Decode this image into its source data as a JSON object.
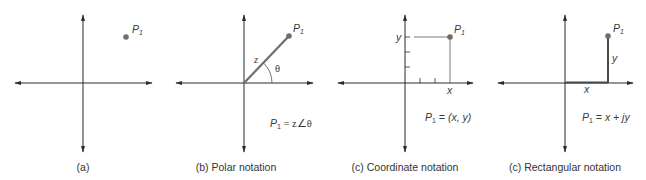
{
  "panels": [
    {
      "id": "a",
      "caption": "(a)",
      "point_label": "P",
      "point_sub": "1",
      "formula": ""
    },
    {
      "id": "b",
      "caption": "(b)  Polar notation",
      "point_label": "P",
      "point_sub": "1",
      "magnitude_label": "z",
      "angle_label": "θ",
      "formula_lhs": "P",
      "formula_sub": "1",
      "formula_rhs": " = z∠θ"
    },
    {
      "id": "c",
      "caption": "(c)  Coordinate notation",
      "point_label": "P",
      "point_sub": "1",
      "x_label": "x",
      "y_label": "y",
      "formula_lhs": "P",
      "formula_sub": "1",
      "formula_rhs": " = (x, y)"
    },
    {
      "id": "d",
      "caption": "(c)  Rectangular notation",
      "point_label": "P",
      "point_sub": "1",
      "x_label": "x",
      "y_label": "y",
      "formula_lhs": "P",
      "formula_sub": "1",
      "formula_rhs": " = x + jy"
    }
  ],
  "colors": {
    "axis": "#2b2b2b",
    "vector": "#6e6e6e",
    "point": "#6e6e6e",
    "guide": "#555555",
    "text": "#3a3a3a"
  }
}
